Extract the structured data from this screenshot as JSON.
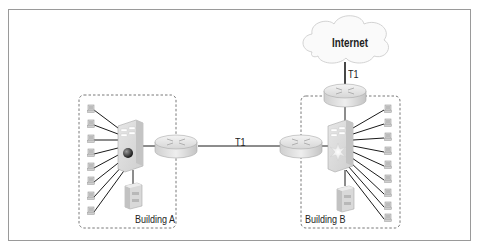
{
  "diagram": {
    "type": "network-topology",
    "nodes": [
      {
        "id": "internet",
        "kind": "cloud",
        "label": "Internet"
      },
      {
        "id": "router-b-wan",
        "kind": "router"
      },
      {
        "id": "router-b",
        "kind": "router"
      },
      {
        "id": "router-a",
        "kind": "router"
      },
      {
        "id": "switch-a",
        "kind": "multilayer-switch"
      },
      {
        "id": "switch-b",
        "kind": "multilayer-switch"
      },
      {
        "id": "server-a",
        "kind": "server"
      },
      {
        "id": "server-b",
        "kind": "server"
      }
    ],
    "groups": [
      {
        "id": "building-a",
        "label": "Building A",
        "workstations": 8
      },
      {
        "id": "building-b",
        "label": "Building B",
        "workstations": 9
      }
    ],
    "links": [
      {
        "from": "router-a",
        "to": "router-b",
        "label": "T1"
      },
      {
        "from": "router-b-wan",
        "to": "internet",
        "label": "T1"
      },
      {
        "from": "switch-a",
        "to": "router-a"
      },
      {
        "from": "switch-b",
        "to": "router-b"
      },
      {
        "from": "switch-b",
        "to": "router-b-wan"
      },
      {
        "from": "switch-a",
        "to": "server-a"
      },
      {
        "from": "switch-b",
        "to": "server-b"
      }
    ]
  },
  "labels": {
    "internet": "Internet",
    "t1_main": "T1",
    "t1_internet": "T1",
    "building_a": "Building A",
    "building_b": "Building B"
  },
  "colors": {
    "frame": "#9a9a9a",
    "line": "#1a1a1a",
    "device_fill": "#e4e4e4",
    "device_shade": "#bdbdbd",
    "dashed": "#555555"
  }
}
